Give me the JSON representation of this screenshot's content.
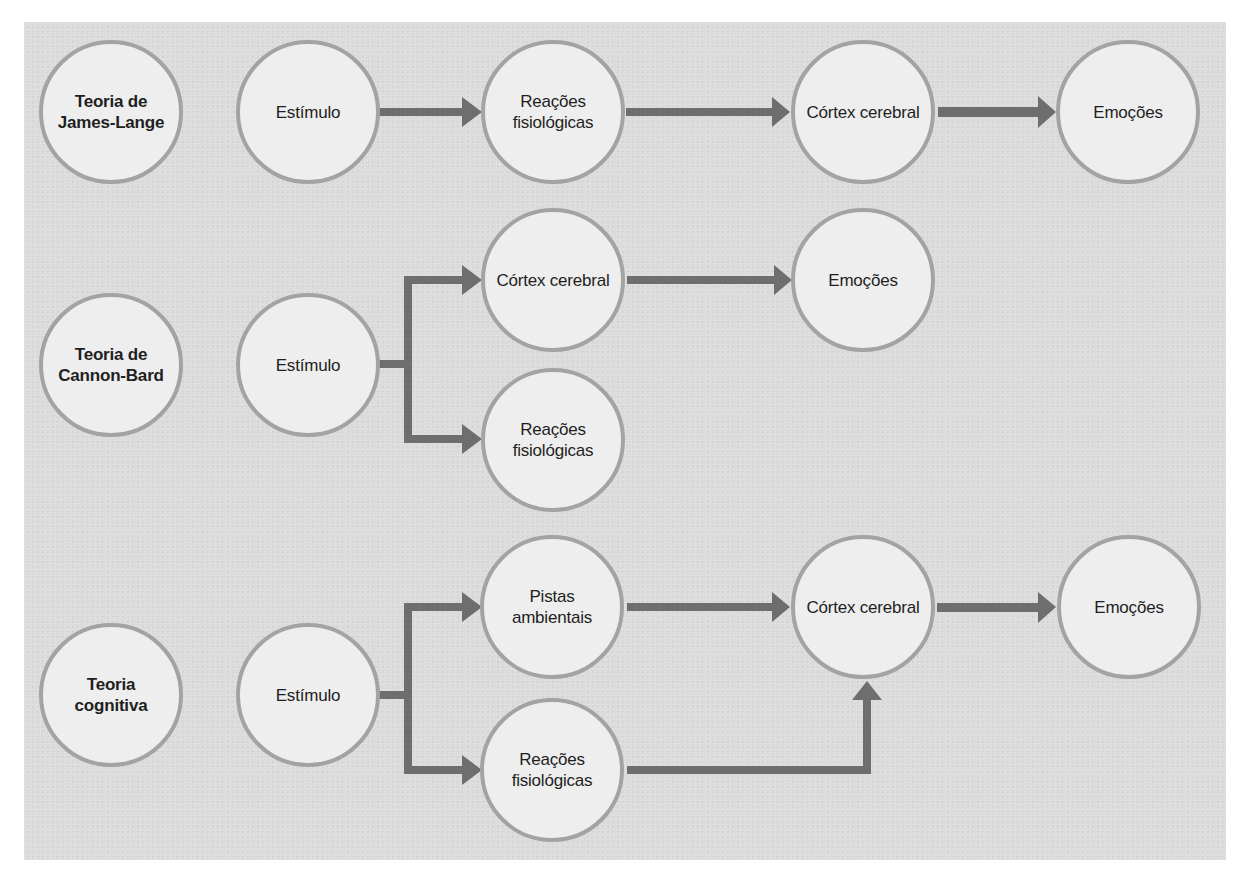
{
  "colors": {
    "panel_background": "#dcdcdc",
    "node_fill": "#eeeeee",
    "node_border": "#a3a3a3",
    "arrow": "#6e6e6e",
    "text": "#1f1f1f"
  },
  "rows": [
    {
      "theory": "Teoria de James-Lange",
      "nodes": {
        "stimulus": "Estímulo",
        "physio": "Reações fisiológicas",
        "cortex": "Córtex cerebral",
        "emotions": "Emoções"
      }
    },
    {
      "theory": "Teoria de Cannon-Bard",
      "nodes": {
        "stimulus": "Estímulo",
        "cortex": "Córtex cerebral",
        "emotions": "Emoções",
        "physio": "Reações fisiológicas"
      }
    },
    {
      "theory": "Teoria cognitiva",
      "nodes": {
        "stimulus": "Estímulo",
        "cues": "Pistas ambientais",
        "cortex": "Córtex cerebral",
        "emotions": "Emoções",
        "physio": "Reações fisiológicas"
      }
    }
  ],
  "edges": [
    {
      "from": "James-Lange: Estímulo",
      "to": "Reações fisiológicas"
    },
    {
      "from": "James-Lange: Reações fisiológicas",
      "to": "Córtex cerebral"
    },
    {
      "from": "James-Lange: Córtex cerebral",
      "to": "Emoções"
    },
    {
      "from": "Cannon-Bard: Estímulo",
      "to": "Córtex cerebral"
    },
    {
      "from": "Cannon-Bard: Estímulo",
      "to": "Reações fisiológicas"
    },
    {
      "from": "Cannon-Bard: Córtex cerebral",
      "to": "Emoções"
    },
    {
      "from": "Cognitiva: Estímulo",
      "to": "Pistas ambientais"
    },
    {
      "from": "Cognitiva: Estímulo",
      "to": "Reações fisiológicas"
    },
    {
      "from": "Cognitiva: Pistas ambientais",
      "to": "Córtex cerebral"
    },
    {
      "from": "Cognitiva: Reações fisiológicas",
      "to": "Córtex cerebral"
    },
    {
      "from": "Cognitiva: Córtex cerebral",
      "to": "Emoções"
    }
  ]
}
